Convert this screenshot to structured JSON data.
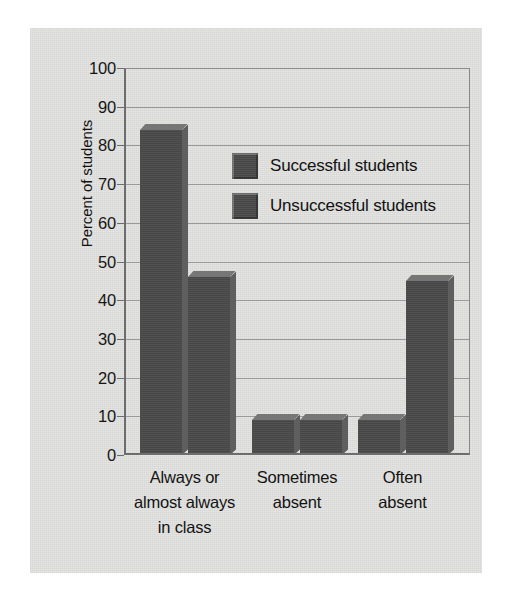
{
  "chart_data": {
    "type": "bar",
    "title": "",
    "subtitle": "",
    "xlabel": "",
    "ylabel": "Percent of students",
    "ylim": [
      0,
      100
    ],
    "yticks": [
      0,
      10,
      20,
      30,
      40,
      50,
      60,
      70,
      80,
      90,
      100
    ],
    "ytick_labels": [
      "0",
      "10",
      "20",
      "30",
      "40",
      "50",
      "60",
      "70",
      "80",
      "90",
      "100"
    ],
    "grid": "horizontal",
    "legend_position": "inside-upper-center",
    "categories": [
      "Always or almost always in class",
      "Sometimes absent",
      "Often absent"
    ],
    "category_label_lines": [
      [
        "Always or",
        "almost always",
        "in class"
      ],
      [
        "Sometimes",
        "absent"
      ],
      [
        "Often",
        "absent"
      ]
    ],
    "series": [
      {
        "name": "Successful students",
        "values": [
          84,
          9,
          9
        ],
        "color": "#4a4a4a"
      },
      {
        "name": "Unsuccessful students",
        "values": [
          46,
          9,
          45
        ],
        "color": "#4a4a4a"
      }
    ]
  },
  "legend": {
    "items": [
      {
        "label": "Successful students"
      },
      {
        "label": "Unsuccessful students"
      }
    ]
  },
  "axes": {
    "y_title": "Percent of students"
  },
  "colors": {
    "bar_fill": "#4a4a4a",
    "bar_top_bevel": "#767676",
    "bar_side_bevel": "#5f5f5f",
    "panel_background": "#e3e3e1",
    "gridline": "#9a9a9a",
    "axis": "#6d6d6d",
    "text": "#131313",
    "page_background": "#ffffff"
  }
}
